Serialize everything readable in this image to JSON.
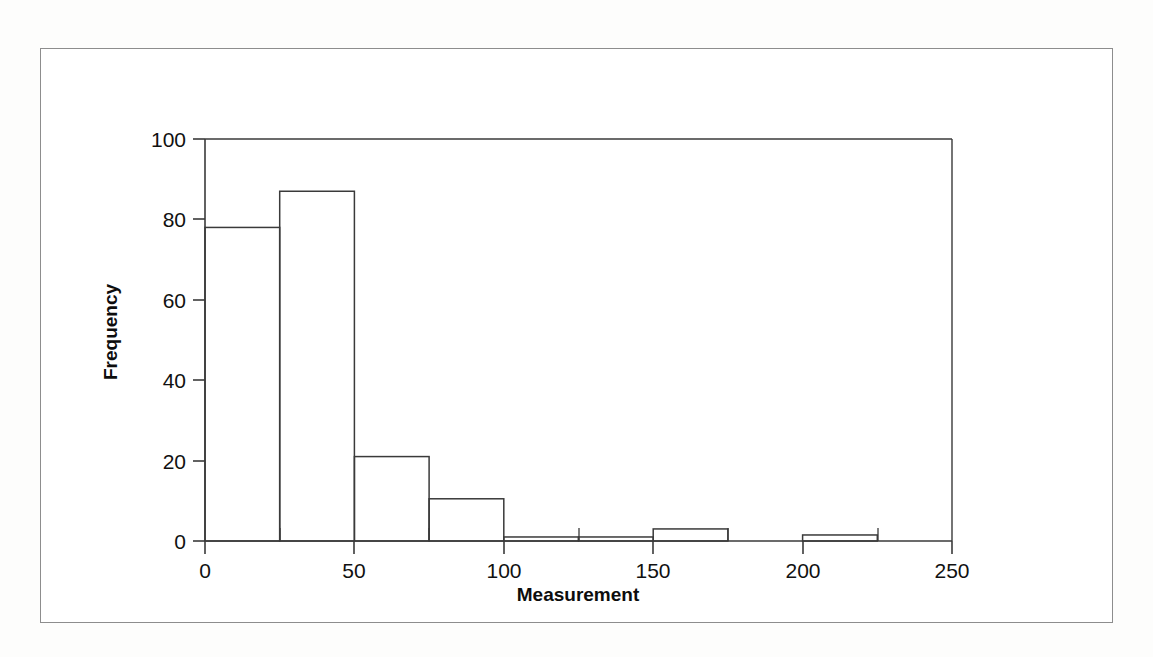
{
  "figure": {
    "background_color": "#ffffff",
    "frame_color": "#8d8d8d",
    "axis_color": "#3a3a3a",
    "bar_line_color": "#3a3a3a"
  },
  "chart_data": {
    "type": "bar",
    "title": "",
    "xlabel": "Measurement",
    "ylabel": "Frequency",
    "xlim": [
      0,
      250
    ],
    "ylim": [
      0,
      100
    ],
    "bin_width": 25,
    "grid": false,
    "legend": "none",
    "xticks": [
      0,
      50,
      100,
      150,
      200,
      250
    ],
    "xtick_labels": [
      "0",
      "50",
      "100",
      "150",
      "200",
      "250"
    ],
    "xminorticks": [
      25,
      75,
      125,
      175,
      225
    ],
    "yticks": [
      0,
      20,
      40,
      60,
      80,
      100
    ],
    "ytick_labels": [
      "0",
      "20",
      "40",
      "60",
      "80",
      "100"
    ],
    "bin_edges": [
      0,
      25,
      50,
      75,
      100,
      125,
      150,
      175,
      200,
      225,
      250
    ],
    "categories": [
      "0-25",
      "25-50",
      "50-75",
      "75-100",
      "100-125",
      "125-150",
      "150-175",
      "175-200",
      "200-225",
      "225-250"
    ],
    "values": [
      78,
      87,
      21,
      10.5,
      1,
      1,
      3,
      0,
      1.5,
      0
    ]
  },
  "axis_labels": {
    "x_title": "Measurement",
    "y_title": "Frequency"
  }
}
